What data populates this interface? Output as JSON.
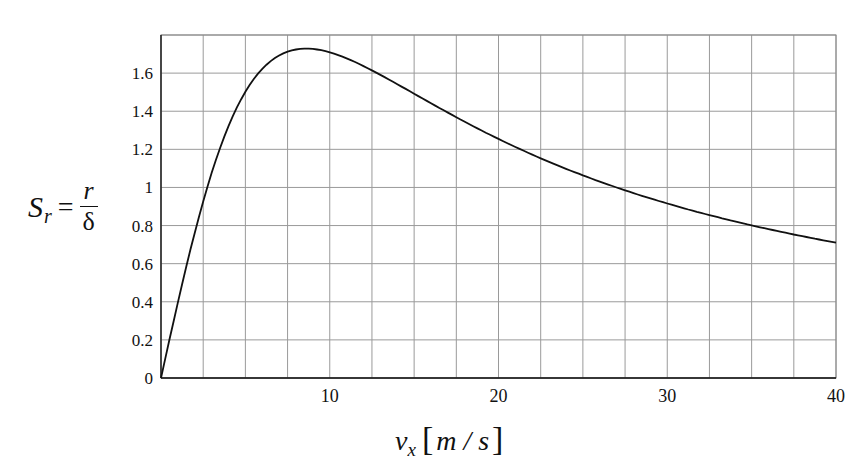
{
  "chart_data": {
    "type": "line",
    "title": "",
    "xlabel": "v_x [m/s]",
    "ylabel": "S_r = r/δ",
    "xlim": [
      0,
      40
    ],
    "ylim": [
      0,
      1.8
    ],
    "grid": true,
    "legend": null,
    "x_ticks": [
      0,
      10,
      20,
      30,
      40
    ],
    "x_tick_labels": [
      "10",
      "20",
      "30",
      "40"
    ],
    "y_ticks": [
      0,
      0.2,
      0.4,
      0.6,
      0.8,
      1,
      1.2,
      1.4,
      1.6
    ],
    "y_tick_labels": [
      "0",
      "0.2",
      "0.4",
      "0.6",
      "0.8",
      "1",
      "1.2",
      "1.4",
      "1.6"
    ],
    "series": [
      {
        "name": "S_r",
        "x": [
          0,
          1,
          2,
          3,
          4,
          5,
          6,
          7,
          8,
          8.6,
          10,
          12,
          14,
          16,
          18,
          20,
          22,
          24,
          26,
          28,
          30,
          32,
          34,
          36,
          38,
          40
        ],
        "values": [
          0,
          0.4,
          0.76,
          1.07,
          1.32,
          1.5,
          1.62,
          1.69,
          1.72,
          1.73,
          1.72,
          1.63,
          1.52,
          1.41,
          1.3,
          1.2,
          1.11,
          1.04,
          0.97,
          0.91,
          0.86,
          0.81,
          0.77,
          0.73,
          0.7,
          0.73
        ]
      }
    ],
    "color": "#111111"
  },
  "labels": {
    "y_main": "S",
    "y_sub": "r",
    "y_eq": "=",
    "y_num": "r",
    "y_den": "δ",
    "x_main": "v",
    "x_sub": "x",
    "x_open": "[",
    "x_unit": "m / s",
    "x_close": "]",
    "origin": "0"
  }
}
